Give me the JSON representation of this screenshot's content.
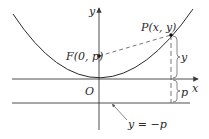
{
  "figure": {
    "type": "parabola-focus-directrix",
    "labels": {
      "y_axis": "y",
      "x_axis": "x",
      "origin": "O",
      "focus": "F(0, p)",
      "point": "P(x, y)",
      "vertical_distance": "y",
      "offset_distance": "p",
      "directrix": "y = −p"
    },
    "colors": {
      "curve": "#2a2a2a",
      "axes": "#3a3a3a",
      "dashed": "#555555",
      "text": "#2a2a2a",
      "background": "#ffffff"
    }
  }
}
